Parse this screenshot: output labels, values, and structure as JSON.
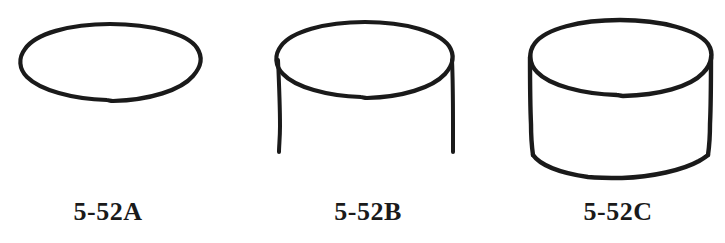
{
  "sheet": {
    "width": 725,
    "height": 243,
    "background_color": "#ffffff",
    "ink_color": "#1a1a1a",
    "style": "hand-drawn pen line art"
  },
  "figures": [
    {
      "id": "fig-a",
      "label": "5-52A",
      "label_center_x": 108,
      "label_baseline_y": 220,
      "description": "ellipse outline only",
      "parts": [
        "top-ellipse"
      ],
      "ellipse": {
        "cx": 110,
        "cy": 62,
        "rx": 91,
        "ry": 39
      }
    },
    {
      "id": "fig-b",
      "label": "5-52B",
      "label_center_x": 368,
      "label_baseline_y": 220,
      "description": "ellipse with two vertical side lines, open bottom",
      "parts": [
        "top-ellipse",
        "left-side-line",
        "right-side-line"
      ],
      "ellipse": {
        "cx": 365,
        "cy": 60,
        "rx": 88,
        "ry": 38
      },
      "side_bottom_y": 152
    },
    {
      "id": "fig-c",
      "label": "5-52C",
      "label_center_x": 618,
      "label_baseline_y": 220,
      "description": "completed cylinder: ellipse, two sides, closed bottom arc",
      "parts": [
        "top-ellipse",
        "left-side-line",
        "right-side-line",
        "bottom-arc"
      ],
      "ellipse": {
        "cx": 620,
        "cy": 58,
        "rx": 91,
        "ry": 38
      },
      "side_bottom_y": 155,
      "bottom_arc_depth_y": 178
    }
  ]
}
